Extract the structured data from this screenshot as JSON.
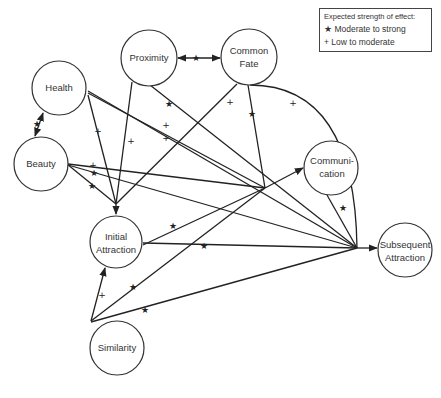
{
  "legend": {
    "title": "Expected strength of effect:",
    "items": [
      {
        "symbol": "★",
        "label": "Moderate to strong"
      },
      {
        "symbol": "+",
        "label": "Low to moderate"
      }
    ]
  },
  "nodes": {
    "health": {
      "label": "Health"
    },
    "proximity": {
      "label": "Proximity"
    },
    "common_fate": {
      "line1": "Common",
      "line2": "Fate"
    },
    "beauty": {
      "label": "Beauty"
    },
    "communication": {
      "line1": "Communi-",
      "line2": "cation"
    },
    "initial_attraction": {
      "line1": "Initial",
      "line2": "Attraction"
    },
    "subsequent_attraction": {
      "line1": "Subsequent",
      "line2": "Attraction"
    },
    "similarity": {
      "label": "Similarity"
    }
  },
  "edges": [
    {
      "from": "Proximity",
      "to": "Common Fate",
      "strength": "★",
      "bidirectional": true
    },
    {
      "from": "Health",
      "to": "Beauty",
      "strength": "★",
      "bidirectional": true
    },
    {
      "from": "Health",
      "to": "Initial Attraction",
      "strength": "+"
    },
    {
      "from": "Health",
      "to": "Communication",
      "strength": "+"
    },
    {
      "from": "Health",
      "to": "Subsequent Attraction",
      "strength": "+"
    },
    {
      "from": "Proximity",
      "to": "Initial Attraction",
      "strength": "+"
    },
    {
      "from": "Proximity",
      "to": "Subsequent Attraction",
      "strength": "★"
    },
    {
      "from": "Common Fate",
      "to": "Initial Attraction",
      "strength": "+"
    },
    {
      "from": "Common Fate",
      "to": "Communication",
      "strength": "★"
    },
    {
      "from": "Common Fate",
      "to": "Subsequent Attraction",
      "strength": "+"
    },
    {
      "from": "Beauty",
      "to": "Communication",
      "strength": "+"
    },
    {
      "from": "Beauty",
      "to": "Subsequent Attraction",
      "strength": "★"
    },
    {
      "from": "Beauty",
      "to": "Initial Attraction",
      "strength": "★"
    },
    {
      "from": "Initial Attraction",
      "to": "Communication",
      "strength": "★"
    },
    {
      "from": "Initial Attraction",
      "to": "Subsequent Attraction",
      "strength": "★"
    },
    {
      "from": "Communication",
      "to": "Subsequent Attraction",
      "strength": "★"
    },
    {
      "from": "Similarity",
      "to": "Initial Attraction",
      "strength": "+"
    },
    {
      "from": "Similarity",
      "to": "Communication",
      "strength": "★"
    },
    {
      "from": "Similarity",
      "to": "Subsequent Attraction",
      "strength": "★"
    }
  ],
  "marks": {
    "star": "★",
    "plus": "+"
  }
}
